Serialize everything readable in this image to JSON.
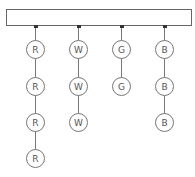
{
  "diagram": {
    "header_bar": {
      "label": ""
    },
    "columns": [
      {
        "name": "R",
        "x": 35,
        "nodes": [
          "R",
          "R",
          "R",
          "R"
        ]
      },
      {
        "name": "W",
        "x": 78,
        "nodes": [
          "W",
          "W",
          "W"
        ]
      },
      {
        "name": "G",
        "x": 121,
        "nodes": [
          "G",
          "G"
        ]
      },
      {
        "name": "B",
        "x": 164,
        "nodes": [
          "B",
          "B",
          "B"
        ]
      }
    ],
    "node_y": [
      49,
      86,
      122,
      158
    ],
    "colors": {
      "stroke": "#777777",
      "text": "#555555",
      "dot": "#333333"
    }
  }
}
